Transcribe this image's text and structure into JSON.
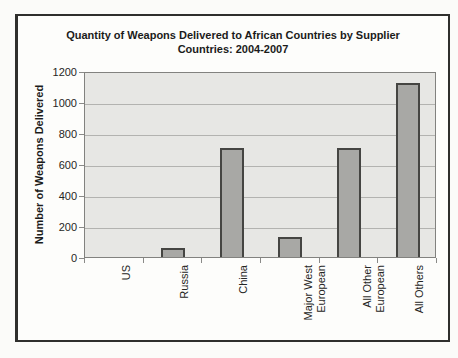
{
  "chart_data": {
    "type": "bar",
    "title": "Quantity of Weapons Delivered to African Countries by Supplier Countries: 2004-2007",
    "title_lines": [
      "Quantity of Weapons Delivered to African Countries by Supplier",
      "Countries: 2004-2007"
    ],
    "categories": [
      "US",
      "Russia",
      "China",
      "Major West European",
      "All Other European",
      "All Others"
    ],
    "category_display_lines": [
      [
        "US"
      ],
      [
        "Russia"
      ],
      [
        "China"
      ],
      [
        "Major West",
        "European"
      ],
      [
        "All Other",
        "European"
      ],
      [
        "All Others"
      ]
    ],
    "values": [
      0,
      60,
      700,
      130,
      700,
      1120
    ],
    "xlabel": "",
    "ylabel": "Number of Weapons Delivered",
    "ylim": [
      0,
      1200
    ],
    "yticks": [
      0,
      200,
      400,
      600,
      800,
      1000,
      1200
    ],
    "grid": true,
    "legend": false,
    "bar_fill": "#a8a8a5",
    "bar_border": "#454542",
    "plot_background": "#e7e7e4",
    "gridline_color": "#b3b3b0"
  }
}
